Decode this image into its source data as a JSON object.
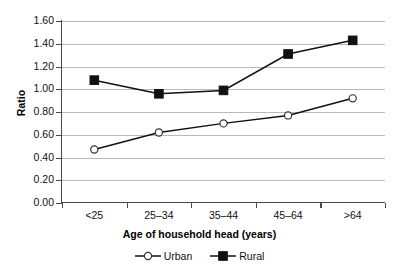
{
  "chart_data": {
    "type": "line",
    "title": "",
    "xlabel": "Age of household head (years)",
    "ylabel": "Ratio",
    "categories": [
      "<25",
      "25–34",
      "35–44",
      "45–64",
      ">64"
    ],
    "ylim": [
      0.0,
      1.6
    ],
    "ytick_step": 0.2,
    "ytick_labels": [
      "0.00",
      "0.20",
      "0.40",
      "0.60",
      "0.80",
      "1.00",
      "1.20",
      "1.40",
      "1.60"
    ],
    "ytick_values": [
      0.0,
      0.2,
      0.4,
      0.6,
      0.8,
      1.0,
      1.2,
      1.4,
      1.6
    ],
    "grid": true,
    "grid_axis": "y",
    "legend_position": "bottom-center",
    "series": [
      {
        "name": "Urban",
        "marker": "open-circle",
        "color": "#111111",
        "values": [
          0.47,
          0.62,
          0.7,
          0.77,
          0.92
        ]
      },
      {
        "name": "Rural",
        "marker": "filled-square",
        "color": "#111111",
        "values": [
          1.08,
          0.96,
          0.99,
          1.31,
          1.43
        ]
      }
    ]
  },
  "legend": {
    "items": [
      {
        "label": "Urban"
      },
      {
        "label": "Rural"
      }
    ]
  },
  "colors": {
    "axis": "#4a4a4a",
    "grid": "#b9b9b9",
    "series": "#111111",
    "background": "#ffffff"
  }
}
